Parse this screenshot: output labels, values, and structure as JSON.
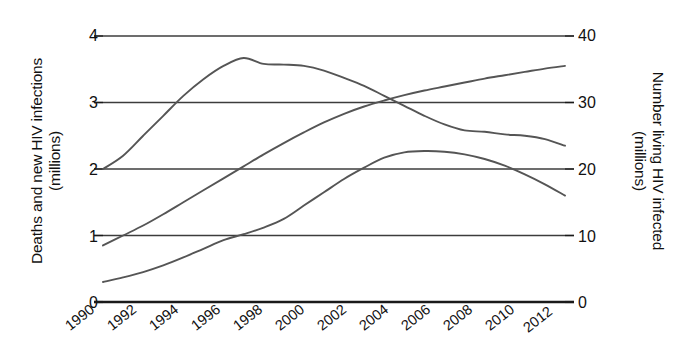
{
  "axes": {
    "left": {
      "title_line1": "Deaths and new HIV infections",
      "title_line2": "(millions)",
      "ticks": [
        "4",
        "3",
        "2",
        "1",
        "0"
      ],
      "min": 0,
      "max": 4
    },
    "right": {
      "title_line1": "Number living HIV infected",
      "title_line2": "(millions)",
      "ticks": [
        "40",
        "30",
        "20",
        "10",
        "0"
      ],
      "min": 0,
      "max": 40
    },
    "x": {
      "ticks": [
        "1990",
        "1992",
        "1994",
        "1996",
        "1998",
        "2000",
        "2002",
        "2004",
        "2006",
        "2008",
        "2010",
        "2012"
      ],
      "min": 1990,
      "max": 2013
    }
  },
  "colors": {
    "line": "#555555",
    "axis": "#1a1a1a",
    "grid": "#3c3c3c",
    "background": "#ffffff"
  },
  "chart_data": {
    "type": "line",
    "title": "",
    "xlabel": "",
    "ylabel": "Deaths and new HIV infections (millions)",
    "y2label": "Number living HIV infected (millions)",
    "xlim": [
      1990,
      2013
    ],
    "ylim": [
      0,
      4
    ],
    "y2lim": [
      0,
      40
    ],
    "grid": true,
    "legend": "none",
    "x": [
      1990,
      1991,
      1992,
      1993,
      1994,
      1995,
      1996,
      1997,
      1998,
      1999,
      2000,
      2001,
      2002,
      2003,
      2004,
      2005,
      2006,
      2007,
      2008,
      2009,
      2010,
      2011,
      2012,
      2013
    ],
    "series": [
      {
        "name": "New HIV infections",
        "axis": "left",
        "units": "millions",
        "values": [
          2.0,
          2.2,
          2.5,
          2.8,
          3.1,
          3.35,
          3.55,
          3.67,
          3.58,
          3.57,
          3.55,
          3.48,
          3.37,
          3.25,
          3.1,
          2.95,
          2.8,
          2.67,
          2.58,
          2.56,
          2.52,
          2.5,
          2.45,
          2.35
        ]
      },
      {
        "name": "AIDS deaths",
        "axis": "left",
        "units": "millions",
        "values": [
          0.3,
          0.37,
          0.45,
          0.55,
          0.67,
          0.8,
          0.93,
          1.02,
          1.12,
          1.25,
          1.45,
          1.65,
          1.85,
          2.02,
          2.17,
          2.25,
          2.27,
          2.26,
          2.22,
          2.15,
          2.05,
          1.92,
          1.77,
          1.6
        ]
      },
      {
        "name": "Number living HIV infected",
        "axis": "right",
        "units": "millions",
        "values": [
          8.5,
          10.0,
          11.5,
          13.2,
          15.0,
          16.8,
          18.6,
          20.4,
          22.2,
          23.9,
          25.5,
          27.0,
          28.3,
          29.4,
          30.3,
          31.1,
          31.8,
          32.4,
          33.0,
          33.6,
          34.1,
          34.6,
          35.1,
          35.5
        ]
      }
    ]
  }
}
